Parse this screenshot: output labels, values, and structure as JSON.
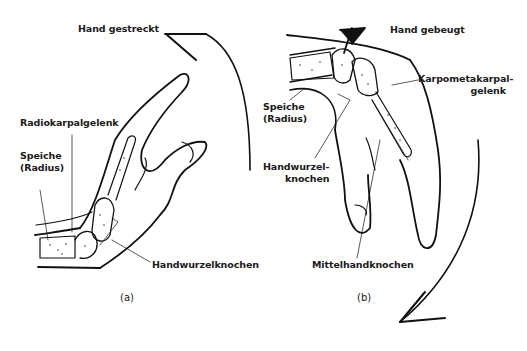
{
  "figure": {
    "panel_a": {
      "caption": "(a)",
      "state_label": "Hand gestreckt",
      "labels": {
        "radiocarpal": "Radiokarpalgelenk",
        "radius_line1": "Speiche",
        "radius_line2": "(Radius)",
        "carpals": "Handwurzelknochen"
      }
    },
    "panel_b": {
      "caption": "(b)",
      "state_label": "Hand gebeugt",
      "labels": {
        "cmc_line1": "Karpometakarpal-",
        "cmc_line2": "gelenk",
        "radius_line1": "Speiche",
        "radius_line2": "(Radius)",
        "carpals_line1": "Handwurzel-",
        "carpals_line2": "knochen",
        "metacarpals": "Mittelhandknochen"
      }
    },
    "colors": {
      "line": "#111111",
      "background": "#ffffff"
    }
  }
}
